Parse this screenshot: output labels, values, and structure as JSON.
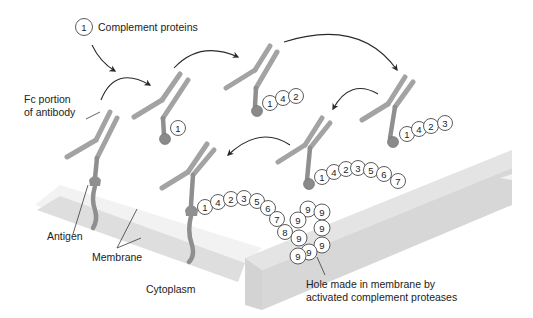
{
  "labels": {
    "complement_key_number": "1",
    "complement_key": "Complement proteins",
    "fc_portion_line1": "Fc portion",
    "fc_portion_line2": "of antibody",
    "antigen": "Antigen",
    "membrane": "Membrane",
    "cytoplasm": "Cytoplasm",
    "hole_line1": "Hole made in membrane by",
    "hole_line2": "activated complement proteases"
  },
  "stages": [
    {
      "name": "stage-1-antibody-antigen",
      "complement_chain": []
    },
    {
      "name": "stage-2",
      "complement_chain": [
        "1"
      ]
    },
    {
      "name": "stage-3",
      "complement_chain": [
        "1",
        "4",
        "2"
      ]
    },
    {
      "name": "stage-4",
      "complement_chain": [
        "1",
        "4",
        "2",
        "3"
      ]
    },
    {
      "name": "stage-5",
      "complement_chain": [
        "1",
        "4",
        "2",
        "3",
        "5",
        "6",
        "7"
      ]
    },
    {
      "name": "stage-6-membrane-attack",
      "complement_chain": [
        "1",
        "4",
        "2",
        "3",
        "5",
        "6",
        "7",
        "8"
      ]
    }
  ],
  "pore_complex": [
    "9",
    "9",
    "9",
    "9",
    "9",
    "9",
    "9",
    "9"
  ],
  "colors": {
    "antibody": "#a3a3a3",
    "antigen": "#8f8f8f",
    "membrane": "#dcdcdc",
    "membrane_side": "#cfcfcf",
    "bead_fill": "#ffffff",
    "bead_stroke": "#4a4a4a"
  }
}
